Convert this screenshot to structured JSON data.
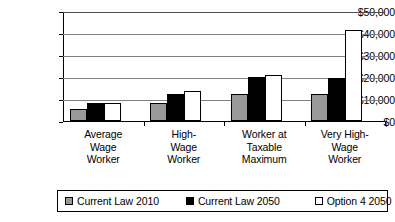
{
  "chart_data": {
    "type": "bar",
    "title": "",
    "subtitle": "",
    "xlabel": "",
    "ylabel": "",
    "categories": [
      "Average\nWage\nWorker",
      "High-\nWage\nWorker",
      "Worker at\nTaxable\nMaximum",
      "Very High-\nWage\nWorker"
    ],
    "series": [
      {
        "name": "Current Law 2010",
        "color": "#999999",
        "values": [
          5500,
          8000,
          12400,
          12300
        ]
      },
      {
        "name": "Current Law 2050",
        "color": "#000000",
        "values": [
          8300,
          12500,
          19800,
          19600
        ]
      },
      {
        "name": "Option 4 2050",
        "color": "#ffffff",
        "values": [
          8300,
          13700,
          20800,
          41200
        ]
      }
    ],
    "ylim": [
      0,
      50000
    ],
    "yticks": [
      0,
      10000,
      20000,
      30000,
      40000,
      50000
    ],
    "ytick_labels": [
      "$0",
      "$10,000",
      "$20,000",
      "$30,000",
      "$40,000",
      "$50,000"
    ],
    "grid": true,
    "legend_position": "bottom"
  }
}
